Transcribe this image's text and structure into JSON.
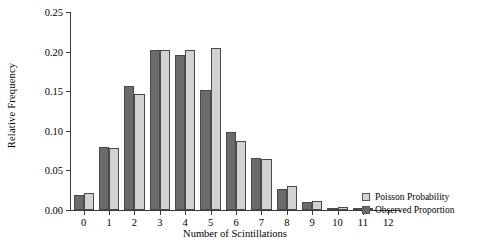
{
  "chart_data": {
    "type": "bar",
    "title": "",
    "xlabel": "Number of Scintillations",
    "ylabel": "Relative Frequency",
    "categories": [
      "0",
      "1",
      "2",
      "3",
      "4",
      "5",
      "6",
      "7",
      "8",
      "9",
      "10",
      "11",
      "12"
    ],
    "series": [
      {
        "name": "Observed Proportion",
        "color": "#6b6b6b",
        "values": [
          0.019,
          0.08,
          0.156,
          0.202,
          0.196,
          0.152,
          0.098,
          0.066,
          0.027,
          0.01,
          0.003,
          0.001,
          0.0
        ]
      },
      {
        "name": "Poisson Probability",
        "color": "#d2d2d2",
        "values": [
          0.021,
          0.078,
          0.147,
          0.202,
          0.202,
          0.205,
          0.087,
          0.065,
          0.03,
          0.012,
          0.004,
          0.001,
          0.0
        ]
      }
    ],
    "ylim": [
      0,
      0.25
    ],
    "yticks": [
      "0.00",
      "0.05",
      "0.10",
      "0.15",
      "0.20",
      "0.25"
    ],
    "ytick_values": [
      0.0,
      0.05,
      0.1,
      0.15,
      0.2,
      0.25
    ],
    "grid": false,
    "legend_position": "right"
  },
  "legend": {
    "entries": [
      {
        "label": "Poisson Probability",
        "swatch": "poisson"
      },
      {
        "label": "Observed Proportion",
        "swatch": "observed"
      }
    ]
  }
}
